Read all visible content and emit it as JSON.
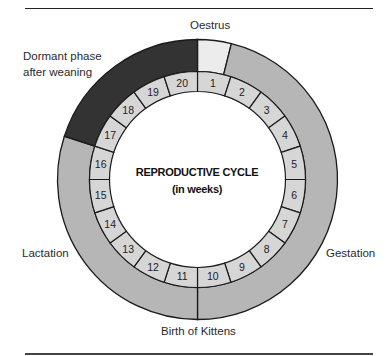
{
  "diagram": {
    "title": "REPRODUCTIVE CYCLE",
    "subtitle": "(in weeks)",
    "weeks": [
      "1",
      "2",
      "3",
      "4",
      "5",
      "6",
      "7",
      "8",
      "9",
      "10",
      "11",
      "12",
      "13",
      "14",
      "15",
      "16",
      "17",
      "18",
      "19",
      "20"
    ],
    "phases": [
      {
        "name": "Oestrus",
        "start_deg": 0,
        "end_deg": 14,
        "color": "#ececec"
      },
      {
        "name": "Gestation",
        "start_deg": 14,
        "end_deg": 180,
        "color": "#b6b6b6"
      },
      {
        "name": "Lactation",
        "start_deg": 180,
        "end_deg": 288,
        "color": "#b6b6b6"
      },
      {
        "name": "Dormant phase after weaning",
        "start_deg": 288,
        "end_deg": 360,
        "color": "#333333"
      }
    ],
    "labels": {
      "oestrus": "Oestrus",
      "dormant_line1": "Dormant phase",
      "dormant_line2": "after weaning",
      "lactation": "Lactation",
      "gestation": "Gestation",
      "birth": "Birth of Kittens"
    },
    "colors": {
      "week_cell": "#d6d6d6",
      "stroke": "#1a1a1a"
    }
  }
}
